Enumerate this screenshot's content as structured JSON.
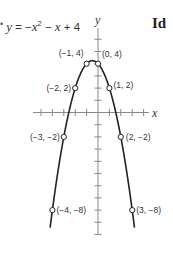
{
  "corner_text": "Id",
  "equation": {
    "lhs": "y",
    "eq": " = −",
    "x1": "x",
    "exp": "2",
    "mid": " − ",
    "x2": "x",
    "tail": " + 4"
  },
  "chart_data": {
    "type": "line",
    "xlabel": "x",
    "ylabel": "y",
    "xlim": [
      -5.5,
      4.5
    ],
    "ylim": [
      -10,
      7
    ],
    "grid": false,
    "legend": "none",
    "x": [
      -4,
      -3,
      -2,
      -1,
      0,
      1,
      2,
      3
    ],
    "values": [
      -8,
      -2,
      2,
      4,
      4,
      2,
      -2,
      -8
    ],
    "points": [
      {
        "x": -4,
        "y": -8,
        "label": "(−4, −8)"
      },
      {
        "x": -3,
        "y": -2,
        "label": "(−3, −2)"
      },
      {
        "x": -2,
        "y": 2,
        "label": "(−2, 2)"
      },
      {
        "x": -1,
        "y": 4,
        "label": "(−1, 4)"
      },
      {
        "x": 0,
        "y": 4,
        "label": "(0, 4)"
      },
      {
        "x": 1,
        "y": 2,
        "label": "(1, 2)"
      },
      {
        "x": 2,
        "y": -2,
        "label": "(2, −2)"
      },
      {
        "x": 3,
        "y": -8,
        "label": "(3, −8)"
      }
    ]
  }
}
